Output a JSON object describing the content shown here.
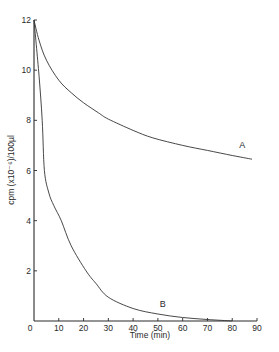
{
  "chart_data": {
    "type": "line",
    "title": "",
    "xlabel": "Time  (min)",
    "ylabel": "cpm (x10⁻⁶)/100µl",
    "xlim": [
      0,
      90
    ],
    "ylim": [
      0,
      12
    ],
    "xticks": [
      0,
      10,
      20,
      30,
      40,
      50,
      60,
      70,
      80,
      90
    ],
    "yticks": [
      2,
      4,
      6,
      8,
      10,
      12
    ],
    "grid": false,
    "legend": "none (curves labeled inline)",
    "series": [
      {
        "name": "A",
        "label_position": {
          "x": 84,
          "y": 6.9
        },
        "x": [
          0,
          2,
          5,
          10,
          15,
          20,
          26,
          30,
          40,
          48,
          60,
          70,
          80,
          88
        ],
        "y": [
          12.0,
          11.2,
          10.4,
          9.6,
          9.1,
          8.7,
          8.3,
          8.05,
          7.6,
          7.3,
          7.0,
          6.8,
          6.6,
          6.45
        ]
      },
      {
        "name": "B",
        "label_position": {
          "x": 52,
          "y": 0.55
        },
        "x": [
          0,
          2,
          3.3,
          4.2,
          6,
          8,
          11,
          15,
          21,
          25,
          30,
          40,
          50,
          60,
          70,
          80
        ],
        "y": [
          12.0,
          9.8,
          8.0,
          6.0,
          5.1,
          4.6,
          4.0,
          3.0,
          2.0,
          1.5,
          0.95,
          0.5,
          0.28,
          0.14,
          0.06,
          0.0
        ]
      }
    ]
  }
}
